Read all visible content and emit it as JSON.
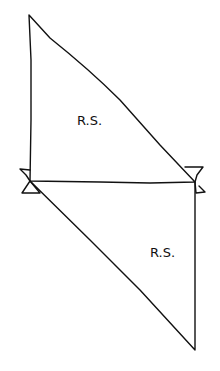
{
  "diagram": {
    "type": "truss-sketch",
    "stroke_color": "#111111",
    "background": "#ffffff",
    "upper_triangle": {
      "label": "R.S.",
      "vertices": [
        [
          29,
          15
        ],
        [
          30,
          181
        ],
        [
          195,
          182
        ]
      ]
    },
    "lower_triangle": {
      "label": "R.S.",
      "vertices": [
        [
          30,
          181
        ],
        [
          195,
          182
        ],
        [
          195,
          350
        ]
      ]
    },
    "supports": [
      {
        "name": "left-joint",
        "at": [
          30,
          181
        ]
      },
      {
        "name": "right-joint",
        "at": [
          195,
          182
        ]
      }
    ]
  }
}
